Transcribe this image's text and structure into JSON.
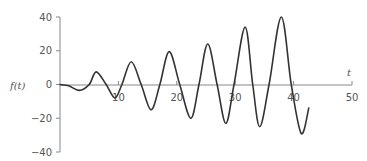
{
  "chart_data": {
    "type": "line",
    "title": "",
    "xlabel": "t",
    "ylabel": "f(t)",
    "xlim": [
      0,
      50
    ],
    "ylim": [
      -40,
      40
    ],
    "x_ticks": [
      10,
      20,
      30,
      40,
      50
    ],
    "y_ticks": [
      40,
      20,
      0,
      -20,
      -40
    ],
    "x_tick_labels": [
      "10",
      "20",
      "30",
      "40",
      "50"
    ],
    "y_tick_labels": [
      "40",
      "20",
      "0",
      "−20",
      "−40"
    ],
    "grid": false,
    "legend": null,
    "series": [
      {
        "name": "f(t)",
        "color": "#333333",
        "x": [
          0,
          1.5,
          3.3,
          5.0,
          6.2,
          7.9,
          9.4,
          10.6,
          12.2,
          13.9,
          15.6,
          17.1,
          18.7,
          20.5,
          22.4,
          23.8,
          25.3,
          26.9,
          28.4,
          29.8,
          31.7,
          33.0,
          34.2,
          35.8,
          37.9,
          39.6,
          41.3,
          42.6
        ],
        "y": [
          0,
          -0.8,
          -3.5,
          0,
          7.5,
          0,
          -8,
          0,
          13.5,
          0,
          -15,
          0,
          19.5,
          0,
          -20,
          0,
          24,
          0,
          -23,
          0,
          34,
          0,
          -25,
          0,
          40,
          0,
          -29,
          -14
        ]
      }
    ]
  },
  "axes": {
    "x_label": "t",
    "y_label": "f(t)"
  }
}
